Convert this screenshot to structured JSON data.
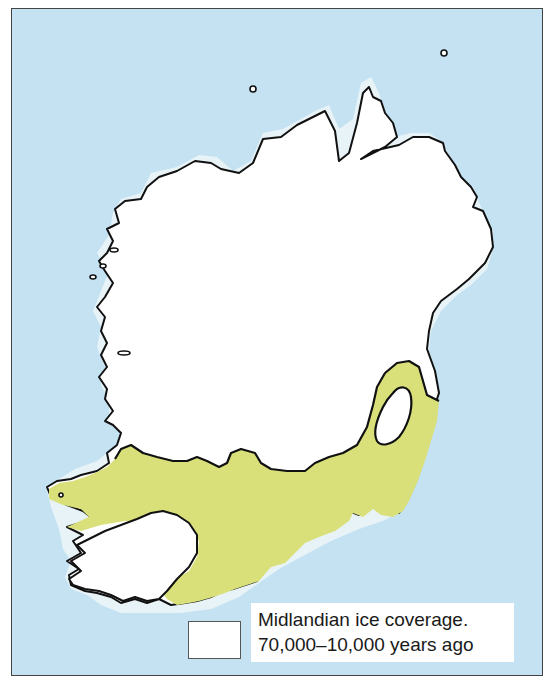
{
  "map": {
    "subject": "Ireland",
    "colors": {
      "sea": "#c4e2f2",
      "ice_coverage": "#ffffff",
      "ice_free_land": "#d9e07a",
      "coastline": "#111111",
      "frame_border": "#444444"
    }
  },
  "legend": {
    "items": [
      {
        "swatch_color": "#ffffff",
        "line1": "Midlandian ice coverage.",
        "line2": "70,000–10,000 years ago"
      }
    ]
  }
}
